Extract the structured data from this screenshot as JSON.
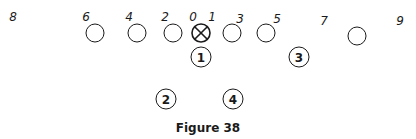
{
  "figure": {
    "caption": "Figure 38",
    "stroke_color": "#1a1a1a",
    "background": "#ffffff"
  },
  "hole_numbers": [
    {
      "label": "8",
      "x": 13,
      "y": 17
    },
    {
      "label": "6",
      "x": 86,
      "y": 17
    },
    {
      "label": "4",
      "x": 129,
      "y": 17
    },
    {
      "label": "2",
      "x": 165,
      "y": 17
    },
    {
      "label": "0",
      "x": 193,
      "y": 17
    },
    {
      "label": "1",
      "x": 212,
      "y": 17
    },
    {
      "label": "3",
      "x": 240,
      "y": 19
    },
    {
      "label": "5",
      "x": 277,
      "y": 19
    },
    {
      "label": "7",
      "x": 324,
      "y": 21
    },
    {
      "label": "9",
      "x": 400,
      "y": 21
    }
  ],
  "linemen": [
    {
      "x": 95,
      "y": 33
    },
    {
      "x": 137,
      "y": 33
    },
    {
      "x": 173,
      "y": 33
    },
    {
      "x": 232,
      "y": 33
    },
    {
      "x": 266,
      "y": 33
    },
    {
      "x": 357,
      "y": 36
    }
  ],
  "center": {
    "x": 201,
    "y": 33,
    "symbol": "⊗"
  },
  "backs": [
    {
      "label": "1",
      "x": 201,
      "y": 57
    },
    {
      "label": "3",
      "x": 299,
      "y": 57
    },
    {
      "label": "2",
      "x": 166,
      "y": 99
    },
    {
      "label": "4",
      "x": 233,
      "y": 99
    }
  ]
}
